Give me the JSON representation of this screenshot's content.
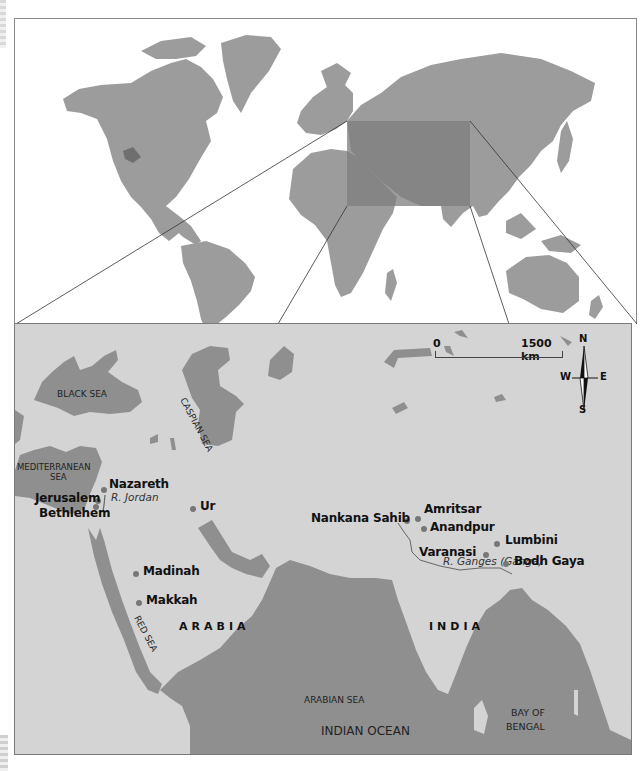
{
  "world_map": {
    "highlight_box": {
      "x": 346,
      "y": 120,
      "w": 123,
      "h": 85
    },
    "colors": {
      "land": "#9a9a9a",
      "highlight": "#7e7e7e",
      "lakes": "#6f6f6f",
      "background": "#ffffff"
    }
  },
  "region_map": {
    "colors": {
      "land": "#d4d4d4",
      "water": "#8f8f8f",
      "dot": "#777777",
      "river": "#666666"
    },
    "scale_bar": {
      "start_label": "0",
      "end_label": "1500 km"
    },
    "compass": {
      "north": "N",
      "south": "S",
      "east": "E",
      "west": "W"
    },
    "seas": {
      "black_sea": "BLACK SEA",
      "caspian_sea": "CASPIAN SEA",
      "mediterranean_sea_line1": "MEDITERRANEAN",
      "mediterranean_sea_line2": "SEA",
      "red_sea": "RED SEA",
      "arabian_sea": "ARABIAN SEA",
      "bay_of_bengal_line1": "BAY OF",
      "bay_of_bengal_line2": "BENGAL",
      "indian_ocean": "INDIAN OCEAN"
    },
    "regions": {
      "arabia": "ARABIA",
      "india": "INDIA"
    },
    "rivers": {
      "jordan": "R. Jordan",
      "ganges": "R. Ganges (Ganga)"
    },
    "cities": [
      {
        "name": "Nazareth"
      },
      {
        "name": "Jerusalem"
      },
      {
        "name": "Bethlehem"
      },
      {
        "name": "Ur"
      },
      {
        "name": "Madinah"
      },
      {
        "name": "Makkah"
      },
      {
        "name": "Nankana Sahib"
      },
      {
        "name": "Amritsar"
      },
      {
        "name": "Anandpur"
      },
      {
        "name": "Lumbini"
      },
      {
        "name": "Varanasi"
      },
      {
        "name": "Bodh Gaya"
      }
    ]
  }
}
